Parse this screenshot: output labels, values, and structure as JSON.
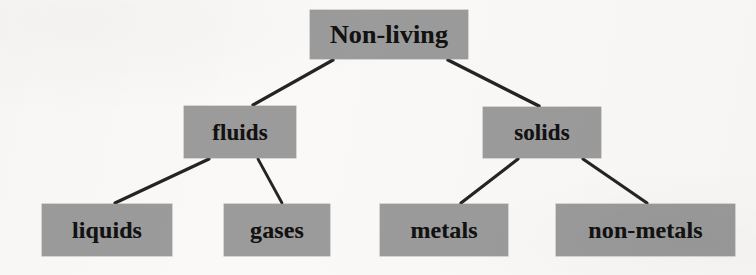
{
  "diagram": {
    "type": "tree",
    "title_text": "Non-living",
    "background_color": "#faf9f7",
    "box_fill_color": "#9b9b9b",
    "text_color": "#121212",
    "connector_color": "#242424",
    "nodes": [
      {
        "id": "root",
        "label": "Non-living",
        "level": 0,
        "x": 310,
        "y": 10,
        "width": 158,
        "height": 49
      },
      {
        "id": "fluids",
        "label": "fluids",
        "level": 1,
        "parent": "root",
        "x": 184,
        "y": 106,
        "width": 112,
        "height": 52
      },
      {
        "id": "solids",
        "label": "solids",
        "level": 1,
        "parent": "root",
        "x": 483,
        "y": 107,
        "width": 118,
        "height": 51
      },
      {
        "id": "liquids",
        "label": "liquids",
        "level": 2,
        "parent": "fluids",
        "x": 42,
        "y": 204,
        "width": 130,
        "height": 52
      },
      {
        "id": "gases",
        "label": "gases",
        "level": 2,
        "parent": "fluids",
        "x": 224,
        "y": 204,
        "width": 106,
        "height": 52
      },
      {
        "id": "metals",
        "label": "metals",
        "level": 2,
        "parent": "solids",
        "x": 380,
        "y": 204,
        "width": 128,
        "height": 52
      },
      {
        "id": "nonmetals",
        "label": "non-metals",
        "level": 2,
        "parent": "solids",
        "x": 556,
        "y": 204,
        "width": 179,
        "height": 52
      }
    ],
    "connectors": [
      {
        "id": "root-fluids",
        "from": "root",
        "to": "fluids",
        "x1": 333,
        "y1": 60,
        "x2": 253,
        "y2": 105
      },
      {
        "id": "root-solids",
        "from": "root",
        "to": "solids",
        "x1": 448,
        "y1": 60,
        "x2": 539,
        "y2": 106
      },
      {
        "id": "fluids-liquids",
        "from": "fluids",
        "to": "liquids",
        "x1": 209,
        "y1": 159,
        "x2": 115,
        "y2": 203
      },
      {
        "id": "fluids-gases",
        "from": "fluids",
        "to": "gases",
        "x1": 258,
        "y1": 159,
        "x2": 282,
        "y2": 203
      },
      {
        "id": "solids-metals",
        "from": "solids",
        "to": "metals",
        "x1": 518,
        "y1": 159,
        "x2": 461,
        "y2": 203
      },
      {
        "id": "solids-nonmetals",
        "from": "solids",
        "to": "nonmetals",
        "x1": 583,
        "y1": 159,
        "x2": 647,
        "y2": 203
      }
    ]
  }
}
